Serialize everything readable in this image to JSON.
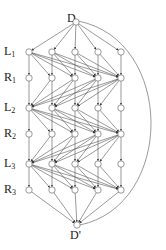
{
  "diagram": {
    "type": "layered-directed-graph",
    "colors": {
      "stroke": "#555555",
      "node_fill": "#ffffff",
      "text": "#222222"
    },
    "source": {
      "label": "D",
      "x": 76,
      "y": 22,
      "label_x": 67,
      "label_y": 12
    },
    "sink": {
      "label": "D'",
      "x": 77,
      "y": 225,
      "label_x": 70,
      "label_y": 229
    },
    "columns_x": [
      29,
      52,
      75,
      98,
      121
    ],
    "layers": [
      {
        "name": "L",
        "sub": "1",
        "y": 52
      },
      {
        "name": "R",
        "sub": "1",
        "y": 78
      },
      {
        "name": "L",
        "sub": "2",
        "y": 108
      },
      {
        "name": "R",
        "sub": "2",
        "y": 134
      },
      {
        "name": "L",
        "sub": "3",
        "y": 164
      },
      {
        "name": "R",
        "sub": "3",
        "y": 190
      }
    ],
    "arc": {
      "from": "D",
      "to": "D'",
      "max_x": 157
    }
  }
}
